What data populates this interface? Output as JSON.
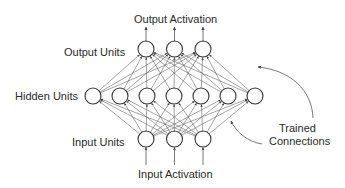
{
  "labels": {
    "output_activation": "Output Activation",
    "output_units": "Output Units",
    "hidden_units": "Hidden Units",
    "input_units": "Input Units",
    "input_activation": "Input Activation",
    "trained_connections_line1": "Trained",
    "trained_connections_line2": "Connections"
  },
  "layers": {
    "input": {
      "count": 3
    },
    "hidden": {
      "count": 7
    },
    "output": {
      "count": 3
    }
  },
  "colors": {
    "stroke": "#333333",
    "edge": "#555555",
    "text": "#2a2a2a",
    "background": "#ffffff"
  }
}
